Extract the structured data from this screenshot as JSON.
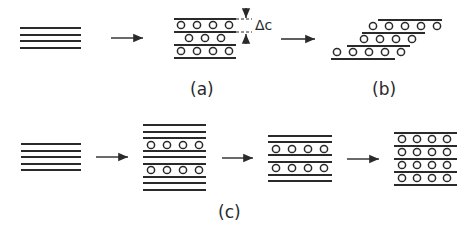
{
  "figure": {
    "panels": [
      {
        "id": "a",
        "label": "(a)",
        "description": "Pristine layers intercalated, expanded interlayer spacing",
        "annotation": "Δc"
      },
      {
        "id": "b",
        "label": "(b)",
        "description": "Sheared / shifted intercalated layers"
      },
      {
        "id": "c",
        "label": "(c)",
        "description": "Staging sequence: stage-3 → stage-2 → stage-1 intercalation"
      }
    ],
    "row1": {
      "pristine_layers": 4,
      "a_rows_guests": [
        4,
        3,
        4
      ],
      "b_rows_guests": [
        5,
        4,
        5
      ]
    },
    "row2": {
      "pristine_layers": 5,
      "stage3_guest_rows": [
        4,
        4
      ],
      "stage2_guest_rows": [
        4,
        4
      ],
      "stage1_guest_rows": [
        4,
        4,
        4,
        4
      ]
    }
  }
}
